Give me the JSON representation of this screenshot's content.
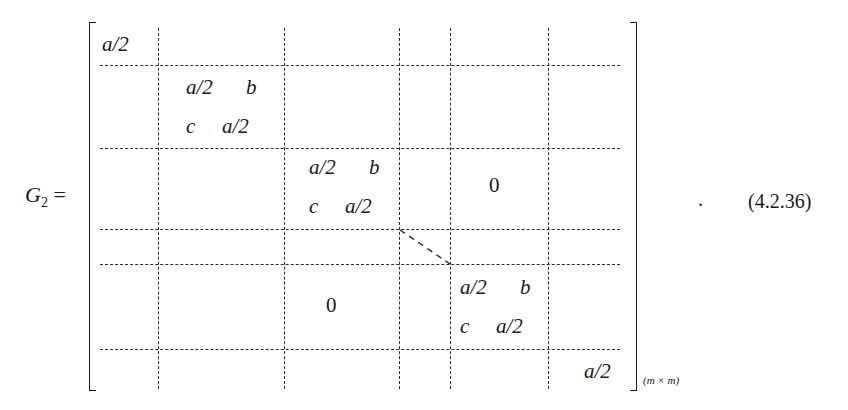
{
  "equation": {
    "lhs": {
      "symbol": "G",
      "subscript": "2",
      "equals": "="
    },
    "matrix": {
      "dimension_label": "(m × m)",
      "blocks": [
        {
          "position": "r1c1",
          "rows": [
            [
              "a/2"
            ]
          ]
        },
        {
          "position": "r2c2",
          "rows": [
            [
              "a/2",
              "b"
            ],
            [
              "c",
              "a/2"
            ]
          ]
        },
        {
          "position": "r3c3",
          "rows": [
            [
              "a/2",
              "b"
            ],
            [
              "c",
              "a/2"
            ]
          ]
        },
        {
          "position": "upper-right",
          "text": "0"
        },
        {
          "position": "lower-left",
          "text": "0"
        },
        {
          "position": "r5c5",
          "rows": [
            [
              "a/2",
              "b"
            ],
            [
              "c",
              "a/2"
            ]
          ]
        },
        {
          "position": "r6c6",
          "rows": [
            [
              "a/2"
            ]
          ]
        }
      ]
    },
    "terminator": ".",
    "number": "(4.2.36)"
  }
}
